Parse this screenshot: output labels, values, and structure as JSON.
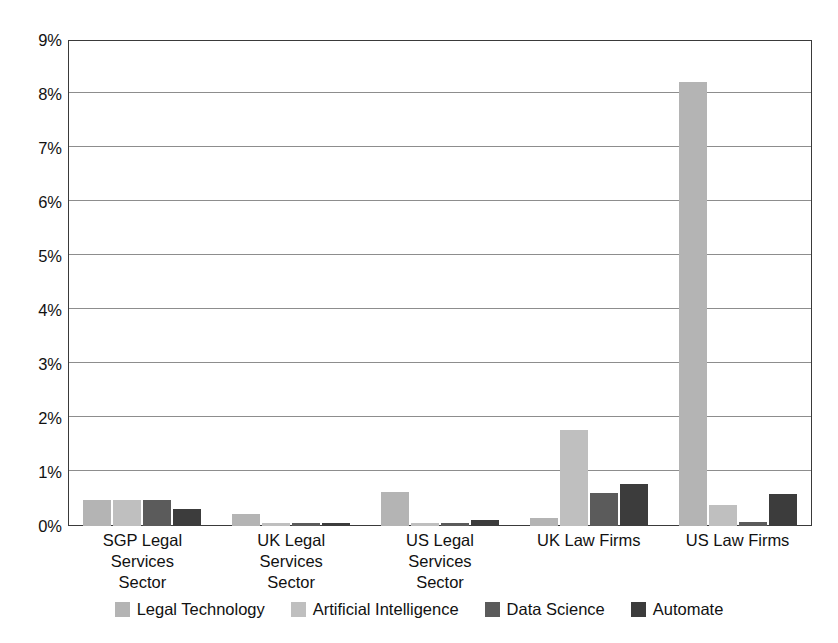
{
  "chart_data": {
    "type": "bar",
    "title": "",
    "subtitle": "",
    "xlabel": "",
    "ylabel": "",
    "ylim": [
      0,
      9
    ],
    "ytick_values": [
      0,
      1,
      2,
      3,
      4,
      5,
      6,
      7,
      8,
      9
    ],
    "ytick_labels": [
      "0%",
      "1%",
      "2%",
      "3%",
      "4%",
      "5%",
      "6%",
      "7%",
      "8%",
      "9%"
    ],
    "grid": true,
    "grid_axis": "y",
    "legend_position": "bottom",
    "value_unit": "%",
    "categories": [
      "SGP Legal\nServices\nSector",
      "UK Legal\nServices\nSector",
      "US Legal\nServices\nSector",
      "UK Law Firms",
      "US Law Firms"
    ],
    "series": [
      {
        "name": "Legal Technology",
        "color": "#b4b4b4",
        "values": [
          0.48,
          0.23,
          0.63,
          0.14,
          8.22
        ]
      },
      {
        "name": "Artificial Intelligence",
        "color": "#bfbfbf",
        "values": [
          0.48,
          0.05,
          0.05,
          1.77,
          0.38
        ]
      },
      {
        "name": "Data Science",
        "color": "#5b5b5b",
        "values": [
          0.49,
          0.05,
          0.05,
          0.62,
          0.07
        ]
      },
      {
        "name": "Automate",
        "color": "#3c3c3c",
        "values": [
          0.31,
          0.05,
          0.11,
          0.77,
          0.6
        ]
      }
    ]
  },
  "axis": {
    "frame_color": "#3a3a3a",
    "grid_color": "#8d8d8d"
  }
}
